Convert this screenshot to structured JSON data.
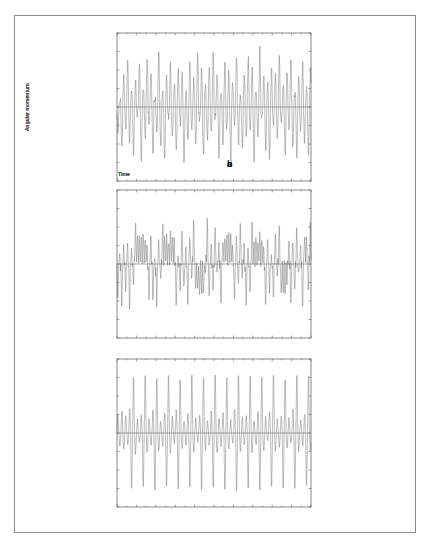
{
  "figure": {
    "background_color": "#ffffff",
    "frame_color": "#8e8e8e",
    "trace_color": "#6b6b6b",
    "axis_color": "#555555",
    "zero_line_color": "#555555"
  },
  "panels": [
    {
      "tag": "a",
      "xlabel": "Time",
      "ylabel": "Angular momentum"
    },
    {
      "tag": "b",
      "xlabel": "Time",
      "ylabel": "Angular momentum"
    },
    {
      "tag": "c",
      "xlabel": "Time",
      "ylabel": "Angular momentum"
    }
  ],
  "chart_data": [
    {
      "type": "line",
      "panel": "a",
      "title": "",
      "xlabel": "Time",
      "ylabel": "Angular momentum",
      "xlim": [
        0,
        100
      ],
      "ylim": [
        -1,
        1
      ],
      "grid": false,
      "legend": null,
      "axis_ticks": {
        "x_major_count": 10,
        "y_major_count": 8,
        "x_tick_labels": [],
        "y_tick_labels": [],
        "ticks_inward": true
      },
      "annotations": [
        {
          "text": "a",
          "position": "outside-bottom-right",
          "bold": true
        }
      ],
      "reference_lines": [
        {
          "orientation": "horizontal",
          "y": 0
        }
      ],
      "description": "Chaotic angular-momentum time series: dense irregular spikes of varying amplitude crossing zero, no visible periodicity.",
      "series": [
        {
          "name": "angular momentum",
          "color": "#6b6b6b",
          "y": [
            -0.42,
            0.14,
            -0.66,
            0.58,
            -0.3,
            0.74,
            -0.52,
            0.22,
            -0.78,
            0.4,
            -0.12,
            0.66,
            -0.84,
            0.3,
            -0.48,
            0.8,
            -0.24,
            0.54,
            -0.7,
            0.18,
            -0.36,
            0.88,
            -0.6,
            0.26,
            -0.82,
            0.46,
            -0.16,
            0.7,
            -0.44,
            0.34,
            -0.74,
            0.62,
            -0.28,
            0.5,
            -0.86,
            0.2,
            -0.56,
            0.78,
            -0.34,
            0.42,
            -0.64,
            0.9,
            -0.22,
            0.58,
            -0.76,
            0.32,
            -0.5,
            0.68,
            -0.4,
            0.84,
            -0.18,
            0.46,
            -0.8,
            0.24,
            -0.62,
            0.72,
            -0.36,
            0.54,
            -0.88,
            0.38,
            -0.26,
            0.82,
            -0.58,
            0.16,
            -0.7,
            0.48,
            -0.44,
            0.76,
            -0.32,
            0.6,
            -0.84,
            0.28,
            -0.52,
            0.92,
            -0.2,
            0.44,
            -0.66,
            0.36,
            -0.78,
            0.64,
            -0.3,
            0.56,
            -0.48,
            0.86,
            -0.24,
            0.4,
            -0.72,
            0.52,
            -0.38,
            0.74,
            -0.6,
            0.22,
            -0.82,
            0.46,
            -0.34,
            0.68,
            -0.54,
            0.3,
            -0.76,
            0.58
          ]
        }
      ]
    },
    {
      "type": "line",
      "panel": "b",
      "title": "",
      "xlabel": "Time",
      "ylabel": "Angular momentum",
      "xlim": [
        0,
        100
      ],
      "ylim": [
        -1,
        1
      ],
      "grid": false,
      "legend": null,
      "axis_ticks": {
        "x_major_count": 10,
        "y_major_count": 8,
        "x_tick_labels": [],
        "y_tick_labels": [],
        "ticks_inward": true
      },
      "annotations": [
        {
          "text": "b",
          "position": "outside-bottom-right",
          "bold": true
        }
      ],
      "reference_lines": [
        {
          "orientation": "horizontal",
          "y": 0
        }
      ],
      "description": "Intermittent chaotic series: alternating bursts of large-amplitude swings separated by lower-amplitude plateau intervals that linger above or below zero.",
      "series": [
        {
          "name": "angular momentum",
          "color": "#6b6b6b",
          "y": [
            -0.7,
            0.3,
            -0.86,
            0.44,
            -0.62,
            0.58,
            -0.9,
            0.34,
            -0.56,
            0.7,
            0.42,
            0.48,
            0.38,
            0.52,
            0.4,
            0.46,
            -0.84,
            0.62,
            -0.74,
            0.26,
            -0.92,
            0.54,
            -0.4,
            0.66,
            0.44,
            0.5,
            0.36,
            0.56,
            0.42,
            0.6,
            -0.88,
            0.3,
            -0.66,
            0.74,
            -0.5,
            0.38,
            -0.8,
            0.58,
            -0.34,
            0.86,
            -0.44,
            -0.38,
            -0.5,
            -0.42,
            -0.54,
            -0.36,
            0.92,
            -0.7,
            0.46,
            -0.6,
            0.78,
            -0.28,
            0.52,
            -0.84,
            0.36,
            0.48,
            0.4,
            0.56,
            0.44,
            0.5,
            -0.76,
            0.64,
            -0.46,
            0.82,
            -0.32,
            0.58,
            -0.88,
            0.4,
            -0.68,
            0.72,
            0.38,
            0.46,
            0.34,
            0.52,
            0.42,
            0.48,
            -0.9,
            0.56,
            -0.54,
            0.3,
            -0.78,
            0.68,
            -0.36,
            0.84,
            -0.48,
            -0.4,
            -0.52,
            -0.44,
            0.6,
            -0.82,
            0.44,
            -0.62,
            0.76,
            -0.3,
            0.54,
            -0.86,
            0.38,
            0.66,
            -0.58,
            0.9
          ]
        }
      ]
    },
    {
      "type": "line",
      "panel": "c",
      "title": "",
      "xlabel": "Time",
      "ylabel": "Angular momentum",
      "xlim": [
        0,
        100
      ],
      "ylim": [
        -1,
        1
      ],
      "grid": false,
      "legend": null,
      "axis_ticks": {
        "x_major_count": 10,
        "y_major_count": 8,
        "x_tick_labels": [],
        "y_tick_labels": [],
        "ticks_inward": true
      },
      "annotations": [
        {
          "text": "c",
          "position": "outside-bottom-right",
          "bold": true
        }
      ],
      "reference_lines": [
        {
          "orientation": "horizontal",
          "y": 0
        }
      ],
      "description": "Quasi-periodic series: regularly spaced tall positive spikes paired with deep negative excursions, with small-amplitude ripples between them.",
      "series": [
        {
          "name": "angular momentum",
          "color": "#6b6b6b",
          "y": [
            0.3,
            -0.2,
            0.34,
            -0.26,
            0.28,
            -0.18,
            0.4,
            -0.92,
            0.94,
            -0.34,
            0.22,
            -0.14,
            0.3,
            -0.9,
            0.96,
            -0.3,
            0.24,
            -0.18,
            0.36,
            -0.94,
            0.92,
            -0.28,
            0.2,
            -0.22,
            0.32,
            -0.88,
            0.95,
            -0.32,
            0.26,
            -0.16,
            0.38,
            -0.93,
            0.9,
            -0.26,
            0.22,
            -0.2,
            0.34,
            -0.91,
            0.96,
            -0.3,
            0.24,
            -0.14,
            0.3,
            -0.94,
            0.93,
            -0.28,
            0.2,
            -0.18,
            0.36,
            -0.89,
            0.95,
            -0.34,
            0.26,
            -0.22,
            0.32,
            -0.92,
            0.91,
            -0.26,
            0.22,
            -0.16,
            0.38,
            -0.95,
            0.94,
            -0.3,
            0.24,
            -0.2,
            0.3,
            -0.9,
            0.96,
            -0.32,
            0.2,
            -0.18,
            0.34,
            -0.93,
            0.92,
            -0.28,
            0.26,
            -0.14,
            0.36,
            -0.91,
            0.95,
            -0.34,
            0.22,
            -0.22,
            0.3,
            -0.94,
            0.9,
            -0.26,
            0.24,
            -0.16,
            0.38,
            -0.92,
            0.96,
            -0.3,
            0.2,
            -0.2,
            0.32,
            -0.89,
            0.93,
            -0.28
          ]
        }
      ]
    }
  ]
}
